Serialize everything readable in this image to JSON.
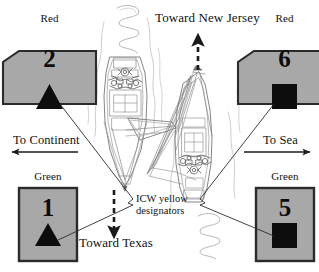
{
  "diagram": {
    "background_color": "#ffffff",
    "line_color": "#1a1a1a",
    "marker_fill": "#a8a8a8",
    "marker_stroke": "#2b2b2b",
    "symbol_fill": "#0d0d0d",
    "boat_sketch_color": "#8c8c8c"
  },
  "markers": [
    {
      "id": "marker-2",
      "color_label": "Red",
      "number": "2",
      "shape": "pentagon",
      "symbol": "triangle",
      "position": "top-left"
    },
    {
      "id": "marker-6",
      "color_label": "Red",
      "number": "6",
      "shape": "pentagon",
      "symbol": "square",
      "position": "top-right"
    },
    {
      "id": "marker-1",
      "color_label": "Green",
      "number": "1",
      "shape": "rectangle",
      "symbol": "triangle",
      "position": "bottom-left"
    },
    {
      "id": "marker-5",
      "color_label": "Green",
      "number": "5",
      "shape": "rectangle",
      "symbol": "square",
      "position": "bottom-right"
    }
  ],
  "direction_labels": {
    "toward_new_jersey": "Toward New Jersey",
    "toward_texas": "Toward Texas",
    "to_continent": "To Continent",
    "to_sea": "To Sea"
  },
  "annotation": {
    "line1": "ICW yellow",
    "line2": "designators"
  },
  "arrows": [
    {
      "name": "arrow-toward-new-jersey",
      "direction": "up",
      "style": "dashed"
    },
    {
      "name": "arrow-toward-texas",
      "direction": "down",
      "style": "dashed"
    },
    {
      "name": "arrow-to-continent",
      "direction": "left",
      "style": "solid"
    },
    {
      "name": "arrow-to-sea",
      "direction": "right",
      "style": "solid"
    }
  ],
  "vessels": [
    {
      "name": "sailboat-left",
      "orientation": "bow-down"
    },
    {
      "name": "sailboat-right",
      "orientation": "bow-up"
    }
  ]
}
